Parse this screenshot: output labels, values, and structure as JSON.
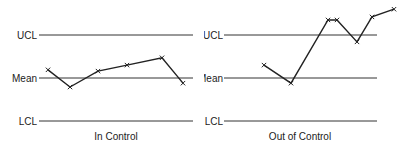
{
  "chart_data": [
    {
      "type": "line",
      "title": "In Control",
      "control_limits": {
        "UCL": 1,
        "Mean": 0,
        "LCL": -1
      },
      "limit_labels": [
        "UCL",
        "Mean",
        "LCL"
      ],
      "x": [
        1,
        2,
        3,
        4,
        5,
        6
      ],
      "values": [
        0.19,
        -0.21,
        0.16,
        0.3,
        0.47,
        -0.12
      ],
      "marker": "x",
      "xlabel": "",
      "ylabel": "",
      "ylim": [
        -1.1,
        1.9
      ],
      "grid": false
    },
    {
      "type": "line",
      "title": "Out of Control",
      "control_limits": {
        "UCL": 1,
        "Mean": 0,
        "LCL": -1
      },
      "limit_labels": [
        "UCL",
        "Mean",
        "LCL"
      ],
      "x": [
        1,
        2,
        3,
        4,
        5,
        6,
        7
      ],
      "values": [
        0.3,
        -0.12,
        1.35,
        1.35,
        0.84,
        1.42,
        1.6
      ],
      "marker": "x",
      "xlabel": "",
      "ylabel": "",
      "ylim": [
        -1.1,
        1.9
      ],
      "grid": false
    }
  ],
  "charts": {
    "left": {
      "title": "In Control",
      "ucl_label": "UCL",
      "mean_label": "Mean",
      "lcl_label": "LCL"
    },
    "right": {
      "title": "Out of Control",
      "ucl_label": "UCL",
      "mean_label": "Mean",
      "lcl_label": "LCL"
    }
  },
  "colors": {
    "line": "#222222",
    "limit": "#333333",
    "background": "#ffffff"
  }
}
